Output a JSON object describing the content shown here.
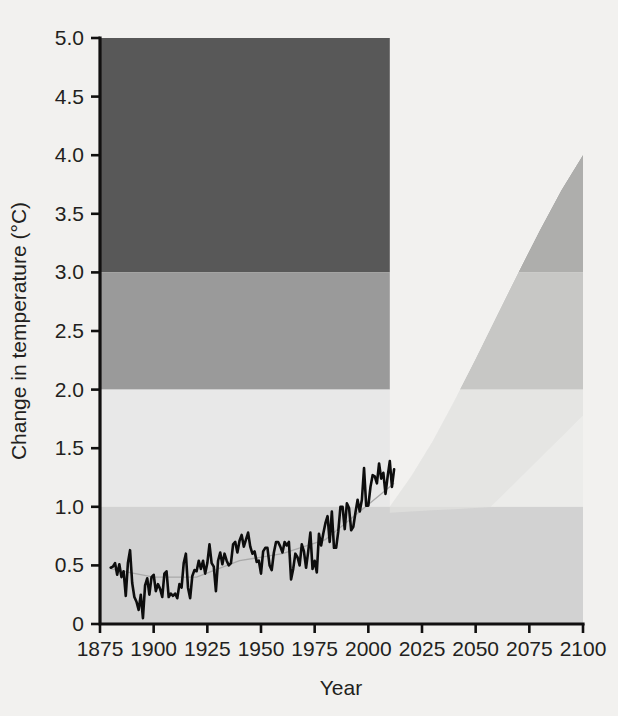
{
  "figure": {
    "background_color": "#f2f1ef",
    "plot_left_px": 100,
    "plot_right_px": 583,
    "plot_top_px": 38,
    "plot_bottom_px": 624
  },
  "axes": {
    "x_title": "Year",
    "y_title": "Change in temperature (°C)",
    "x_ticks": [
      "1875",
      "1900",
      "1925",
      "1950",
      "1975",
      "2000",
      "2025",
      "2050",
      "2075",
      "2100"
    ],
    "y_ticks": [
      "0",
      "0.5",
      "1.0",
      "1.5",
      "2.0",
      "2.5",
      "3.0",
      "3.5",
      "4.0",
      "4.5",
      "5.0"
    ]
  },
  "colors": {
    "band_very_high": "#585858",
    "band_high": "#9a9a9a",
    "band_moderate": "#e8e8e8",
    "band_low": "#d2d2d2",
    "cone_overlay": "#e4e3e1",
    "cone_inner_light": "#eeeeec",
    "observed_line": "#0d0d0d",
    "trend_line": "#a9a9a9",
    "axis": "#111010",
    "text": "#231f20"
  },
  "chart_data": {
    "type": "line",
    "title": "",
    "subtitle": "",
    "xlabel": "Year",
    "ylabel": "Change in temperature (°C)",
    "xlim": [
      1875,
      2100
    ],
    "ylim": [
      0,
      5.0
    ],
    "xticks": [
      1875,
      1900,
      1925,
      1950,
      1975,
      2000,
      2025,
      2050,
      2075,
      2100
    ],
    "yticks": [
      0,
      0.5,
      1.0,
      1.5,
      2.0,
      2.5,
      3.0,
      3.5,
      4.0,
      4.5,
      5.0
    ],
    "grid": false,
    "legend": "none",
    "risk_bands": [
      {
        "name": "very-high",
        "y_from": 3.0,
        "y_to": 5.0,
        "color": "#585858"
      },
      {
        "name": "high",
        "y_from": 2.0,
        "y_to": 3.0,
        "color": "#9a9a9a"
      },
      {
        "name": "moderate",
        "y_from": 1.0,
        "y_to": 2.0,
        "color": "#e8e8e8"
      },
      {
        "name": "low",
        "y_from": 0.0,
        "y_to": 1.0,
        "color": "#d2d2d2"
      }
    ],
    "projection_cone": {
      "name": "Projected warming range",
      "upper_bound": [
        {
          "x": 2010,
          "y": 1.0
        },
        {
          "x": 2020,
          "y": 1.26
        },
        {
          "x": 2030,
          "y": 1.56
        },
        {
          "x": 2040,
          "y": 1.9
        },
        {
          "x": 2050,
          "y": 2.26
        },
        {
          "x": 2060,
          "y": 2.63
        },
        {
          "x": 2070,
          "y": 3.0
        },
        {
          "x": 2080,
          "y": 3.36
        },
        {
          "x": 2090,
          "y": 3.7
        },
        {
          "x": 2100,
          "y": 4.0
        }
      ],
      "lower_bound": [
        {
          "x": 2010,
          "y": 0.95
        },
        {
          "x": 2020,
          "y": 0.96
        },
        {
          "x": 2030,
          "y": 0.97
        },
        {
          "x": 2040,
          "y": 0.98
        },
        {
          "x": 2050,
          "y": 0.99
        },
        {
          "x": 2060,
          "y": 1.0
        },
        {
          "x": 2070,
          "y": 1.0
        },
        {
          "x": 2080,
          "y": 1.0
        },
        {
          "x": 2090,
          "y": 1.0
        },
        {
          "x": 2100,
          "y": 1.0
        }
      ]
    },
    "series": [
      {
        "name": "Observed global temperature change",
        "x": [
          1880,
          1881,
          1882,
          1883,
          1884,
          1885,
          1886,
          1887,
          1888,
          1889,
          1890,
          1891,
          1892,
          1893,
          1894,
          1895,
          1896,
          1897,
          1898,
          1899,
          1900,
          1901,
          1902,
          1903,
          1904,
          1905,
          1906,
          1907,
          1908,
          1909,
          1910,
          1911,
          1912,
          1913,
          1914,
          1915,
          1916,
          1917,
          1918,
          1919,
          1920,
          1921,
          1922,
          1923,
          1924,
          1925,
          1926,
          1927,
          1928,
          1929,
          1930,
          1931,
          1932,
          1933,
          1934,
          1935,
          1936,
          1937,
          1938,
          1939,
          1940,
          1941,
          1942,
          1943,
          1944,
          1945,
          1946,
          1947,
          1948,
          1949,
          1950,
          1951,
          1952,
          1953,
          1954,
          1955,
          1956,
          1957,
          1958,
          1959,
          1960,
          1961,
          1962,
          1963,
          1964,
          1965,
          1966,
          1967,
          1968,
          1969,
          1970,
          1971,
          1972,
          1973,
          1974,
          1975,
          1976,
          1977,
          1978,
          1979,
          1980,
          1981,
          1982,
          1983,
          1984,
          1985,
          1986,
          1987,
          1988,
          1989,
          1990,
          1991,
          1992,
          1993,
          1994,
          1995,
          1996,
          1997,
          1998,
          1999,
          2000,
          2001,
          2002,
          2003,
          2004,
          2005,
          2006,
          2007,
          2008,
          2009,
          2010,
          2011,
          2012
        ],
        "y": [
          0.48,
          0.49,
          0.52,
          0.42,
          0.51,
          0.4,
          0.45,
          0.24,
          0.52,
          0.63,
          0.35,
          0.23,
          0.19,
          0.12,
          0.25,
          0.05,
          0.33,
          0.39,
          0.25,
          0.4,
          0.42,
          0.28,
          0.34,
          0.3,
          0.23,
          0.43,
          0.45,
          0.23,
          0.26,
          0.24,
          0.26,
          0.22,
          0.34,
          0.31,
          0.52,
          0.6,
          0.31,
          0.22,
          0.41,
          0.46,
          0.45,
          0.54,
          0.47,
          0.54,
          0.43,
          0.52,
          0.68,
          0.52,
          0.49,
          0.28,
          0.54,
          0.61,
          0.51,
          0.6,
          0.54,
          0.5,
          0.52,
          0.68,
          0.7,
          0.61,
          0.71,
          0.76,
          0.66,
          0.72,
          0.78,
          0.66,
          0.6,
          0.62,
          0.53,
          0.54,
          0.43,
          0.62,
          0.65,
          0.65,
          0.5,
          0.46,
          0.61,
          0.7,
          0.7,
          0.66,
          0.61,
          0.7,
          0.67,
          0.7,
          0.38,
          0.47,
          0.6,
          0.57,
          0.5,
          0.68,
          0.62,
          0.48,
          0.62,
          0.78,
          0.47,
          0.54,
          0.44,
          0.77,
          0.67,
          0.77,
          0.86,
          0.92,
          0.7,
          0.96,
          0.65,
          0.65,
          0.79,
          1.0,
          1.0,
          0.81,
          1.03,
          0.99,
          0.8,
          0.83,
          0.95,
          1.06,
          0.96,
          1.06,
          1.33,
          1.01,
          1.01,
          1.17,
          1.27,
          1.26,
          1.2,
          1.37,
          1.24,
          1.29,
          1.11,
          1.26,
          1.39,
          1.17,
          1.32
        ]
      }
    ],
    "trend_overlay": {
      "name": "Smoothed trend",
      "x": [
        1880,
        1900,
        1920,
        1940,
        1960,
        1980,
        2000,
        2012
      ],
      "y": [
        0.47,
        0.4,
        0.4,
        0.54,
        0.6,
        0.72,
        1.02,
        1.2
      ]
    }
  }
}
